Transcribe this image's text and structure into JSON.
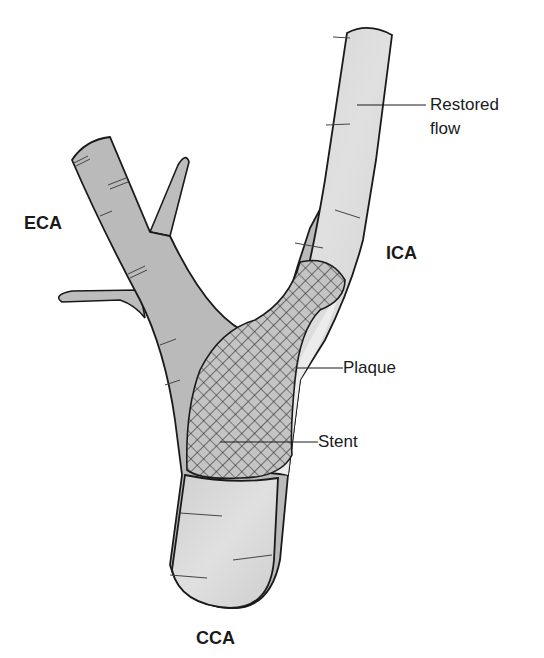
{
  "diagram": {
    "labels": {
      "eca": "ECA",
      "ica": "ICA",
      "cca": "CCA",
      "restored_flow_line1": "Restored",
      "restored_flow_line2": "flow",
      "plaque": "Plaque",
      "stent": "Stent"
    },
    "colors": {
      "vessel_dark": "#b9b9b9",
      "vessel_light": "#d6d6d6",
      "plaque": "#ececec",
      "outline": "#1a1a1a",
      "stent_mesh": "#2a2a2a"
    }
  }
}
